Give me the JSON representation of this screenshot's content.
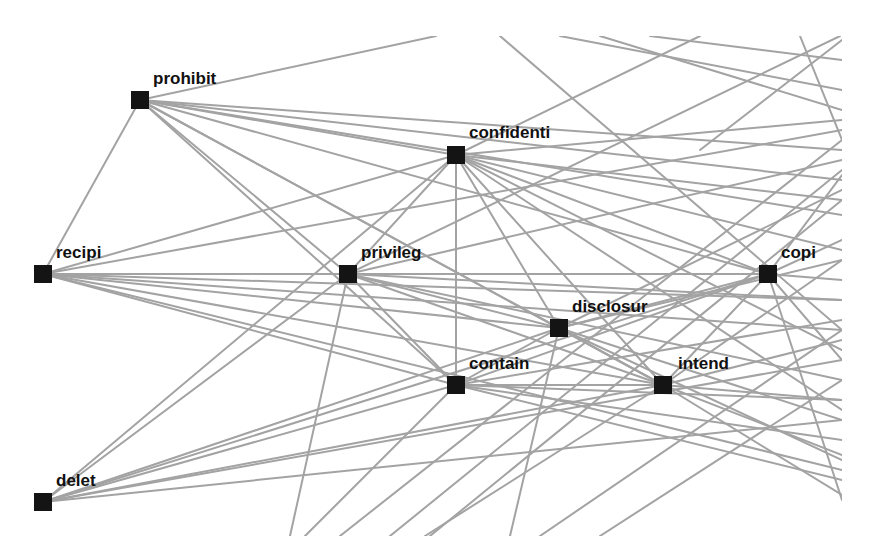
{
  "diagram": {
    "type": "term-cooccurrence-network",
    "clip": {
      "x0": 0,
      "y0": 36,
      "x1": 842,
      "y1": 536
    },
    "colors": {
      "edge": "#a3a3a3",
      "node": "#141414",
      "label": "#111111",
      "background": "#ffffff"
    },
    "nodes": [
      {
        "id": "prohibit",
        "label": "prohibit",
        "x": 140,
        "y": 100,
        "lx": 153,
        "ly": 84
      },
      {
        "id": "confidenti",
        "label": "confidenti",
        "x": 456,
        "y": 155,
        "lx": 469,
        "ly": 138
      },
      {
        "id": "recipi",
        "label": "recipi",
        "x": 43,
        "y": 274,
        "lx": 56,
        "ly": 258
      },
      {
        "id": "privileg",
        "label": "privileg",
        "x": 348,
        "y": 274,
        "lx": 361,
        "ly": 258
      },
      {
        "id": "copi",
        "label": "copi",
        "x": 768,
        "y": 274,
        "lx": 781,
        "ly": 258
      },
      {
        "id": "disclosur",
        "label": "disclosur",
        "x": 559,
        "y": 328,
        "lx": 572,
        "ly": 312
      },
      {
        "id": "contain",
        "label": "contain",
        "x": 456,
        "y": 385,
        "lx": 469,
        "ly": 369
      },
      {
        "id": "intend",
        "label": "intend",
        "x": 663,
        "y": 385,
        "lx": 678,
        "ly": 369
      },
      {
        "id": "delet",
        "label": "delet",
        "x": 43,
        "y": 502,
        "lx": 56,
        "ly": 486
      }
    ],
    "edges": [
      [
        "prohibit",
        "recipi"
      ],
      [
        "prohibit",
        "confidenti"
      ],
      [
        "prohibit",
        "privileg"
      ],
      [
        "prohibit",
        "copi"
      ],
      [
        "prohibit",
        "disclosur"
      ],
      [
        "prohibit",
        "contain"
      ],
      [
        "prohibit",
        "intend"
      ],
      [
        "confidenti",
        "recipi"
      ],
      [
        "confidenti",
        "privileg"
      ],
      [
        "confidenti",
        "copi"
      ],
      [
        "confidenti",
        "disclosur"
      ],
      [
        "confidenti",
        "contain"
      ],
      [
        "confidenti",
        "intend"
      ],
      [
        "confidenti",
        "delet"
      ],
      [
        "recipi",
        "privileg"
      ],
      [
        "recipi",
        "copi"
      ],
      [
        "recipi",
        "disclosur"
      ],
      [
        "recipi",
        "contain"
      ],
      [
        "recipi",
        "intend"
      ],
      [
        "privileg",
        "copi"
      ],
      [
        "privileg",
        "disclosur"
      ],
      [
        "privileg",
        "contain"
      ],
      [
        "privileg",
        "intend"
      ],
      [
        "privileg",
        "delet"
      ],
      [
        "copi",
        "disclosur"
      ],
      [
        "copi",
        "contain"
      ],
      [
        "copi",
        "intend"
      ],
      [
        "copi",
        "delet"
      ],
      [
        "disclosur",
        "contain"
      ],
      [
        "disclosur",
        "intend"
      ],
      [
        "disclosur",
        "delet"
      ],
      [
        "contain",
        "intend"
      ],
      [
        "contain",
        "delet"
      ],
      [
        "intend",
        "delet"
      ]
    ],
    "offscreen_edges": [
      {
        "from": "prohibit",
        "to": [
          436,
          36
        ]
      },
      {
        "from": "prohibit",
        "to": [
          842,
          150
        ]
      },
      {
        "from": "prohibit",
        "to": [
          842,
          180
        ]
      },
      {
        "from": "prohibit",
        "to": [
          842,
          215
        ]
      },
      {
        "from": "recipi",
        "to": [
          842,
          130
        ]
      },
      {
        "from": "recipi",
        "to": [
          842,
          300
        ]
      },
      {
        "from": "recipi",
        "to": [
          842,
          330
        ]
      },
      {
        "from": "recipi",
        "to": [
          842,
          470
        ]
      },
      {
        "from": "confidenti",
        "to": [
          842,
          120
        ]
      },
      {
        "from": "confidenti",
        "to": [
          842,
          200
        ]
      },
      {
        "from": "confidenti",
        "to": [
          842,
          250
        ]
      },
      {
        "from": "confidenti",
        "to": [
          842,
          350
        ]
      },
      {
        "from": "confidenti",
        "to": [
          842,
          410
        ]
      },
      {
        "from": "confidenti",
        "to": [
          700,
          36
        ]
      },
      {
        "from": "privileg",
        "to": [
          842,
          160
        ]
      },
      {
        "from": "privileg",
        "to": [
          842,
          300
        ]
      },
      {
        "from": "privileg",
        "to": [
          842,
          380
        ]
      },
      {
        "from": "privileg",
        "to": [
          290,
          536
        ]
      },
      {
        "from": "privileg",
        "to": [
          840,
          36
        ]
      },
      {
        "from": "copi",
        "to": [
          842,
          240
        ]
      },
      {
        "from": "copi",
        "to": [
          842,
          280
        ]
      },
      {
        "from": "copi",
        "to": [
          842,
          360
        ]
      },
      {
        "from": "copi",
        "to": [
          842,
          500
        ]
      },
      {
        "from": "copi",
        "to": [
          842,
          175
        ]
      },
      {
        "from": "disclosur",
        "to": [
          842,
          190
        ]
      },
      {
        "from": "disclosur",
        "to": [
          842,
          260
        ]
      },
      {
        "from": "disclosur",
        "to": [
          842,
          420
        ]
      },
      {
        "from": "disclosur",
        "to": [
          842,
          460
        ]
      },
      {
        "from": "disclosur",
        "to": [
          510,
          536
        ]
      },
      {
        "from": "contain",
        "to": [
          842,
          320
        ]
      },
      {
        "from": "contain",
        "to": [
          842,
          400
        ]
      },
      {
        "from": "contain",
        "to": [
          842,
          440
        ]
      },
      {
        "from": "contain",
        "to": [
          842,
          480
        ]
      },
      {
        "from": "contain",
        "to": [
          305,
          536
        ]
      },
      {
        "from": "intend",
        "to": [
          842,
          260
        ]
      },
      {
        "from": "intend",
        "to": [
          842,
          340
        ]
      },
      {
        "from": "intend",
        "to": [
          842,
          400
        ]
      },
      {
        "from": "intend",
        "to": [
          842,
          455
        ]
      },
      {
        "from": "intend",
        "to": [
          842,
          495
        ]
      },
      {
        "from": "intend",
        "to": [
          425,
          536
        ]
      },
      {
        "from": "delet",
        "to": [
          842,
          360
        ]
      },
      {
        "from": "delet",
        "to": [
          842,
          420
        ]
      },
      {
        "from": [
          430,
          536
        ],
        "to": [
          842,
          200
        ]
      },
      {
        "from": [
          540,
          536
        ],
        "to": [
          842,
          330
        ]
      },
      {
        "from": [
          600,
          536
        ],
        "to": [
          842,
          380
        ]
      },
      {
        "from": [
          390,
          536
        ],
        "to": [
          842,
          170
        ]
      },
      {
        "from": [
          340,
          536
        ],
        "to": [
          842,
          140
        ]
      },
      {
        "from": [
          500,
          36
        ],
        "to": [
          842,
          330
        ]
      },
      {
        "from": [
          560,
          36
        ],
        "to": [
          842,
          90
        ]
      },
      {
        "from": [
          600,
          36
        ],
        "to": [
          842,
          110
        ]
      },
      {
        "from": [
          650,
          36
        ],
        "to": [
          842,
          60
        ]
      },
      {
        "from": [
          800,
          36
        ],
        "to": [
          842,
          140
        ]
      },
      {
        "from": [
          842,
          40
        ],
        "to": [
          700,
          150
        ]
      }
    ]
  }
}
